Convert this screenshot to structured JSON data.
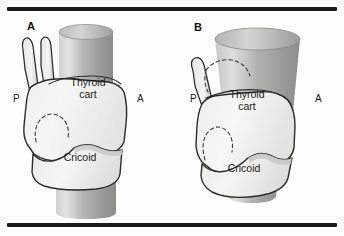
{
  "figure": {
    "background_color": "#fdfdfd",
    "rule_color": "#1b1b1b",
    "outline_color": "#2b2b2b",
    "cartilage_fill": "#f2f2f0",
    "trachea_light": "#d8d8d6",
    "trachea_mid": "#a9a9a7",
    "trachea_dark": "#8e8e8c"
  },
  "panels": [
    {
      "id": "a",
      "letter": "A",
      "labels": {
        "posterior": "P",
        "anterior": "A",
        "thyroid": "Thyroid\ncart",
        "cricoid": "Cricoid"
      }
    },
    {
      "id": "b",
      "letter": "B",
      "labels": {
        "posterior": "P",
        "anterior": "A",
        "thyroid": "Thyroid\ncart",
        "cricoid": "Cricoid"
      }
    }
  ],
  "icons": {
    "top_rule": "horizontal-rule",
    "bottom_rule": "horizontal-rule"
  }
}
